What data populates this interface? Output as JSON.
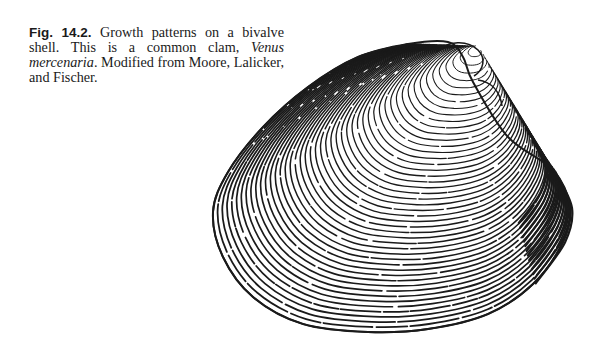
{
  "figure": {
    "label": "Fig. 14.2.",
    "caption_before_italic": " Growth patterns on a bivalve shell. This is a common clam, ",
    "species_italic": "Venus mercenaria",
    "caption_after_italic": ". Modified from Moore, Lalicker, and Fischer.",
    "illustration": "clam-shell-growth-lines-drawing",
    "ink_color": "#1a1a1a",
    "paper_color": "#ffffff"
  }
}
